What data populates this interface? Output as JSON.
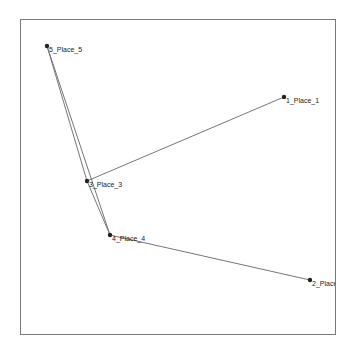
{
  "diagram": {
    "type": "network-graph",
    "nodes": [
      {
        "id": "5",
        "label": "5_Place_5",
        "x": 47,
        "y": 46
      },
      {
        "id": "1",
        "label": "1_Place_1",
        "x": 284,
        "y": 97
      },
      {
        "id": "3",
        "label": "3_Place_3",
        "x": 87,
        "y": 181
      },
      {
        "id": "4",
        "label": "4_Place_4",
        "x": 110,
        "y": 235
      },
      {
        "id": "2",
        "label": "2_Place_",
        "x": 310,
        "y": 280
      }
    ],
    "edges": [
      {
        "from": "5",
        "to": "3"
      },
      {
        "from": "5",
        "to": "4"
      },
      {
        "from": "3",
        "to": "4"
      },
      {
        "from": "3",
        "to": "1"
      },
      {
        "from": "4",
        "to": "2"
      }
    ],
    "colors": {
      "edge": "#777777",
      "node": "#222222",
      "frame": "#7a7a7a",
      "background": "#ffffff"
    }
  }
}
